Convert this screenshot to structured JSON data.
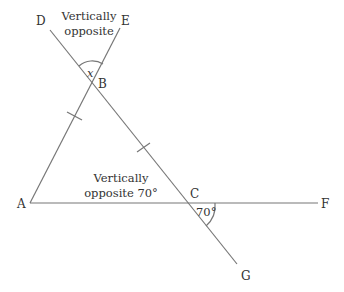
{
  "diagram": {
    "points": {
      "A": {
        "label": "A",
        "x": 30,
        "y": 203
      },
      "B": {
        "label": "B",
        "x": 93,
        "y": 84
      },
      "C": {
        "label": "C",
        "x": 188,
        "y": 203
      },
      "D": {
        "label": "D",
        "x": 50,
        "y": 30
      },
      "E": {
        "label": "E",
        "x": 120,
        "y": 28
      },
      "F": {
        "label": "F",
        "x": 318,
        "y": 203
      },
      "G": {
        "label": "G",
        "x": 237,
        "y": 264
      }
    },
    "annotations": {
      "top_line1": "Vertically",
      "top_line2": "opposite",
      "mid_line1": "Vertically",
      "mid_line2": "opposite 70°",
      "angle_x": "x",
      "angle_c": "70°"
    },
    "line_color": "#777777",
    "text_color": "#333333"
  }
}
